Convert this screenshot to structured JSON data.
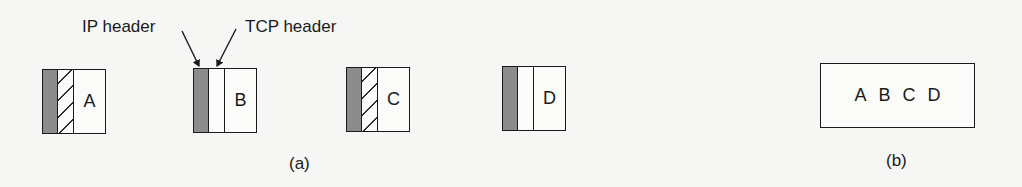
{
  "figure": {
    "part_a": {
      "caption": "(a)",
      "annotations": {
        "ip_header": "IP header",
        "tcp_header": "TCP header"
      },
      "packets": [
        {
          "data": "A",
          "tcp_header_style": "hatched"
        },
        {
          "data": "B",
          "tcp_header_style": "plain"
        },
        {
          "data": "C",
          "tcp_header_style": "hatched"
        },
        {
          "data": "D",
          "tcp_header_style": "plain"
        }
      ]
    },
    "part_b": {
      "caption": "(b)",
      "combined_data": [
        "A",
        "B",
        "C",
        "D"
      ]
    }
  },
  "colors": {
    "ip_header_fill": "#8c8c8c",
    "stroke": "#1a1a1a",
    "background": "#f6f6f4"
  }
}
